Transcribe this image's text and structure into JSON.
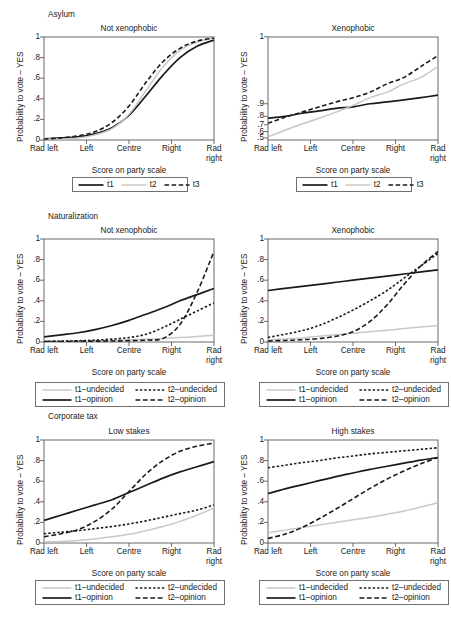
{
  "figure": {
    "axis_labels": {
      "y": "Probability to vote – YES",
      "x": "Score on party scale"
    },
    "x_ticks": [
      "Rad left",
      "Left",
      "Centre",
      "Right",
      "Rad right"
    ],
    "y_ticks_linear": [
      "1",
      ".8",
      ".6",
      ".4",
      ".2",
      "0"
    ],
    "y_ticks_compressed": [
      "1",
      ".9",
      ".8",
      ".7",
      ".6",
      ".5"
    ],
    "colors": {
      "line_black": "#1a1a1a",
      "line_gray": "#c8c8c8",
      "frame": "#5a5a5a",
      "background": "#ffffff"
    },
    "groups": [
      {
        "name": "Asylum",
        "panels": [
          "Not xenophobic",
          "Xenophobic"
        ]
      },
      {
        "name": "Naturalization",
        "panels": [
          "Not xenophobic",
          "Xenophobic"
        ]
      },
      {
        "name": "Corporate tax",
        "panels": [
          "Low stakes",
          "High stakes"
        ]
      }
    ]
  },
  "legends": {
    "asylum": {
      "entries": [
        {
          "label": "t1",
          "style": "solid-black"
        },
        {
          "label": "t2",
          "style": "solid-gray"
        },
        {
          "label": "t3",
          "style": "dashed-black"
        }
      ]
    },
    "four": {
      "entries": [
        {
          "label": "t1–undecided",
          "style": "solid-gray"
        },
        {
          "label": "t2–undecided",
          "style": "shortdash-black"
        },
        {
          "label": "t1–opinion",
          "style": "solid-black"
        },
        {
          "label": "t2–opinion",
          "style": "longdash-black"
        }
      ]
    }
  },
  "chart_data": [
    {
      "id": "asylum-not-xenophobic",
      "type": "line",
      "title": "Not xenophobic",
      "group": "Asylum",
      "xlabel": "Score on party scale",
      "ylabel": "Probability to vote – YES",
      "x": [
        "Rad left",
        "Left",
        "Centre",
        "Right",
        "Rad right"
      ],
      "xlim": [
        0,
        10
      ],
      "ylim": [
        0,
        1
      ],
      "y_scale": "linear",
      "grid": false,
      "legend_position": "below",
      "series": [
        {
          "name": "t1",
          "style": "solid-black",
          "x": [
            0,
            1,
            2,
            3,
            4,
            5,
            6,
            7,
            8,
            9,
            10
          ],
          "values": [
            0.01,
            0.02,
            0.03,
            0.06,
            0.12,
            0.24,
            0.43,
            0.63,
            0.8,
            0.91,
            0.97
          ]
        },
        {
          "name": "t2",
          "style": "solid-gray",
          "x": [
            0,
            1,
            2,
            3,
            4,
            5,
            6,
            7,
            8,
            9,
            10
          ],
          "values": [
            0.01,
            0.01,
            0.02,
            0.05,
            0.11,
            0.25,
            0.48,
            0.71,
            0.87,
            0.95,
            0.99
          ]
        },
        {
          "name": "t3",
          "style": "dashed-black",
          "x": [
            0,
            1,
            2,
            3,
            4,
            5,
            6,
            7,
            8,
            9,
            10
          ],
          "values": [
            0.01,
            0.02,
            0.04,
            0.08,
            0.17,
            0.33,
            0.56,
            0.76,
            0.89,
            0.96,
            0.99
          ]
        }
      ]
    },
    {
      "id": "asylum-xenophobic",
      "type": "line",
      "title": "Xenophobic",
      "group": "Asylum",
      "xlabel": "Score on party scale",
      "ylabel": "Probability to vote – YES",
      "x": [
        "Rad left",
        "Left",
        "Centre",
        "Right",
        "Rad right"
      ],
      "xlim": [
        0,
        10
      ],
      "ylim": [
        0.5,
        1
      ],
      "y_scale": "compressed-top",
      "grid": false,
      "legend_position": "below",
      "series": [
        {
          "name": "t1",
          "style": "solid-black",
          "x": [
            0,
            1,
            2,
            3,
            4,
            5,
            6,
            7,
            8,
            9,
            10
          ],
          "values": [
            0.78,
            0.8,
            0.83,
            0.85,
            0.87,
            0.88,
            0.9,
            0.91,
            0.92,
            0.93,
            0.94
          ]
        },
        {
          "name": "t2",
          "style": "solid-gray",
          "x": [
            0,
            1,
            2,
            3,
            4,
            5,
            6,
            7,
            8,
            9,
            10
          ],
          "values": [
            0.52,
            0.62,
            0.71,
            0.78,
            0.84,
            0.89,
            0.93,
            0.95,
            0.97,
            0.98,
            0.99
          ]
        },
        {
          "name": "t3",
          "style": "dashed-black",
          "x": [
            0,
            1,
            2,
            3,
            4,
            5,
            6,
            7,
            8,
            9,
            10
          ],
          "values": [
            0.72,
            0.79,
            0.84,
            0.88,
            0.91,
            0.93,
            0.95,
            0.97,
            0.98,
            0.99,
            0.995
          ]
        }
      ]
    },
    {
      "id": "naturalization-not-xenophobic",
      "type": "line",
      "title": "Not xenophobic",
      "group": "Naturalization",
      "xlabel": "Score on party scale",
      "ylabel": "Probability to vote – YES",
      "x": [
        "Rad left",
        "Left",
        "Centre",
        "Right",
        "Rad right"
      ],
      "xlim": [
        0,
        10
      ],
      "ylim": [
        0,
        1
      ],
      "y_scale": "linear",
      "grid": false,
      "legend_position": "below",
      "series": [
        {
          "name": "t1–undecided",
          "style": "solid-gray",
          "x": [
            0,
            1,
            2,
            3,
            4,
            5,
            6,
            7,
            8,
            9,
            10
          ],
          "values": [
            0.005,
            0.007,
            0.009,
            0.012,
            0.016,
            0.021,
            0.027,
            0.034,
            0.043,
            0.053,
            0.065
          ]
        },
        {
          "name": "t2–undecided",
          "style": "shortdash-black",
          "x": [
            0,
            1,
            2,
            3,
            4,
            5,
            6,
            7,
            8,
            9,
            10
          ],
          "values": [
            0.005,
            0.008,
            0.012,
            0.018,
            0.028,
            0.043,
            0.075,
            0.14,
            0.22,
            0.3,
            0.38
          ]
        },
        {
          "name": "t1–opinion",
          "style": "solid-black",
          "x": [
            0,
            1,
            2,
            3,
            4,
            5,
            6,
            7,
            8,
            9,
            10
          ],
          "values": [
            0.05,
            0.07,
            0.09,
            0.12,
            0.16,
            0.21,
            0.27,
            0.33,
            0.4,
            0.46,
            0.52
          ]
        },
        {
          "name": "t2–opinion",
          "style": "longdash-black",
          "x": [
            0,
            1,
            2,
            3,
            4,
            5,
            6,
            7,
            8,
            9,
            10
          ],
          "values": [
            0.004,
            0.005,
            0.006,
            0.008,
            0.01,
            0.013,
            0.018,
            0.035,
            0.17,
            0.48,
            0.88
          ]
        }
      ]
    },
    {
      "id": "naturalization-xenophobic",
      "type": "line",
      "title": "Xenophobic",
      "group": "Naturalization",
      "xlabel": "Score on party scale",
      "ylabel": "Probability to vote – YES",
      "x": [
        "Rad left",
        "Left",
        "Centre",
        "Right",
        "Rad right"
      ],
      "xlim": [
        0,
        10
      ],
      "ylim": [
        0,
        1
      ],
      "y_scale": "linear",
      "grid": false,
      "legend_position": "below",
      "series": [
        {
          "name": "t1–undecided",
          "style": "solid-gray",
          "x": [
            0,
            1,
            2,
            3,
            4,
            5,
            6,
            7,
            8,
            9,
            10
          ],
          "values": [
            0.02,
            0.03,
            0.04,
            0.055,
            0.07,
            0.085,
            0.1,
            0.115,
            0.13,
            0.145,
            0.16
          ]
        },
        {
          "name": "t2–undecided",
          "style": "shortdash-black",
          "x": [
            0,
            1,
            2,
            3,
            4,
            5,
            6,
            7,
            8,
            9,
            10
          ],
          "values": [
            0.045,
            0.075,
            0.11,
            0.16,
            0.23,
            0.31,
            0.4,
            0.5,
            0.62,
            0.74,
            0.86
          ]
        },
        {
          "name": "t1–opinion",
          "style": "solid-black",
          "x": [
            0,
            1,
            2,
            3,
            4,
            5,
            6,
            7,
            8,
            9,
            10
          ],
          "values": [
            0.5,
            0.52,
            0.54,
            0.56,
            0.58,
            0.6,
            0.62,
            0.64,
            0.66,
            0.68,
            0.7
          ]
        },
        {
          "name": "t2–opinion",
          "style": "longdash-black",
          "x": [
            0,
            1,
            2,
            3,
            4,
            5,
            6,
            7,
            8,
            9,
            10
          ],
          "values": [
            0.01,
            0.015,
            0.022,
            0.033,
            0.055,
            0.1,
            0.2,
            0.36,
            0.56,
            0.74,
            0.88
          ]
        }
      ]
    },
    {
      "id": "corporate-tax-low-stakes",
      "type": "line",
      "title": "Low stakes",
      "group": "Corporate tax",
      "xlabel": "Score on party scale",
      "ylabel": "Probability to vote – YES",
      "x": [
        "Rad left",
        "Left",
        "Centre",
        "Right",
        "Rad right"
      ],
      "xlim": [
        0,
        10
      ],
      "ylim": [
        0,
        1
      ],
      "y_scale": "linear",
      "grid": false,
      "legend_position": "below",
      "series": [
        {
          "name": "t1–undecided",
          "style": "solid-gray",
          "x": [
            0,
            1,
            2,
            3,
            4,
            5,
            6,
            7,
            8,
            9,
            10
          ],
          "values": [
            0.01,
            0.015,
            0.025,
            0.04,
            0.06,
            0.085,
            0.12,
            0.16,
            0.21,
            0.27,
            0.34
          ]
        },
        {
          "name": "t2–undecided",
          "style": "shortdash-black",
          "x": [
            0,
            1,
            2,
            3,
            4,
            5,
            6,
            7,
            8,
            9,
            10
          ],
          "values": [
            0.09,
            0.105,
            0.12,
            0.14,
            0.16,
            0.185,
            0.215,
            0.25,
            0.285,
            0.32,
            0.37
          ]
        },
        {
          "name": "t1–opinion",
          "style": "solid-black",
          "x": [
            0,
            1,
            2,
            3,
            4,
            5,
            6,
            7,
            8,
            9,
            10
          ],
          "values": [
            0.22,
            0.27,
            0.32,
            0.37,
            0.42,
            0.49,
            0.56,
            0.63,
            0.69,
            0.74,
            0.79
          ]
        },
        {
          "name": "t2–opinion",
          "style": "longdash-black",
          "x": [
            0,
            1,
            2,
            3,
            4,
            5,
            6,
            7,
            8,
            9,
            10
          ],
          "values": [
            0.06,
            0.09,
            0.13,
            0.21,
            0.33,
            0.5,
            0.67,
            0.8,
            0.89,
            0.94,
            0.97
          ]
        }
      ]
    },
    {
      "id": "corporate-tax-high-stakes",
      "type": "line",
      "title": "High stakes",
      "group": "Corporate tax",
      "xlabel": "Score on party scale",
      "ylabel": "Probability to vote – YES",
      "x": [
        "Rad left",
        "Left",
        "Centre",
        "Right",
        "Rad right"
      ],
      "xlim": [
        0,
        10
      ],
      "ylim": [
        0,
        1
      ],
      "y_scale": "linear",
      "grid": false,
      "legend_position": "below",
      "series": [
        {
          "name": "t1–undecided",
          "style": "solid-gray",
          "x": [
            0,
            1,
            2,
            3,
            4,
            5,
            6,
            7,
            8,
            9,
            10
          ],
          "values": [
            0.1,
            0.125,
            0.15,
            0.175,
            0.2,
            0.225,
            0.25,
            0.28,
            0.31,
            0.35,
            0.39
          ]
        },
        {
          "name": "t2–undecided",
          "style": "shortdash-black",
          "x": [
            0,
            1,
            2,
            3,
            4,
            5,
            6,
            7,
            8,
            9,
            10
          ],
          "values": [
            0.73,
            0.755,
            0.78,
            0.8,
            0.825,
            0.845,
            0.865,
            0.88,
            0.895,
            0.91,
            0.925
          ]
        },
        {
          "name": "t1–opinion",
          "style": "solid-black",
          "x": [
            0,
            1,
            2,
            3,
            4,
            5,
            6,
            7,
            8,
            9,
            10
          ],
          "values": [
            0.48,
            0.525,
            0.565,
            0.605,
            0.645,
            0.68,
            0.715,
            0.745,
            0.775,
            0.805,
            0.83
          ]
        },
        {
          "name": "t2–opinion",
          "style": "longdash-black",
          "x": [
            0,
            1,
            2,
            3,
            4,
            5,
            6,
            7,
            8,
            9,
            10
          ],
          "values": [
            0.045,
            0.085,
            0.15,
            0.235,
            0.33,
            0.43,
            0.53,
            0.62,
            0.7,
            0.77,
            0.83
          ]
        }
      ]
    }
  ]
}
